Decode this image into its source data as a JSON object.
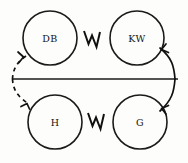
{
  "diagram": {
    "background_color": "#fdfdfb",
    "stroke_color": "#111111",
    "axis": {
      "name": "horizontal-axis-line",
      "orientation": "horizontal",
      "y": 79,
      "x_start": 13,
      "x_end": 178
    },
    "nodes": [
      {
        "id": "db",
        "label": "DB",
        "position": "top-left",
        "cx": 50,
        "cy": 38,
        "r": 27
      },
      {
        "id": "kw",
        "label": "KW",
        "position": "top-right",
        "cx": 137,
        "cy": 38,
        "r": 27
      },
      {
        "id": "h",
        "label": "H",
        "position": "bottom-left",
        "cx": 55,
        "cy": 122,
        "r": 27
      },
      {
        "id": "g",
        "label": "G",
        "position": "bottom-right",
        "cx": 140,
        "cy": 122,
        "r": 27
      }
    ],
    "connectors": [
      {
        "id": "zigzag-db-kw",
        "kind": "zigzag",
        "from": "db",
        "to": "kw",
        "label": ""
      },
      {
        "id": "zigzag-h-g",
        "kind": "zigzag",
        "from": "h",
        "to": "g",
        "label": ""
      },
      {
        "id": "arc-kw-g",
        "kind": "arc-solid-double-arrow",
        "from": "kw",
        "to": "g",
        "side": "right",
        "label": ""
      },
      {
        "id": "arc-db-h",
        "kind": "arc-dashed-double-arrow",
        "from": "db",
        "to": "h",
        "side": "left",
        "label": ""
      }
    ]
  }
}
